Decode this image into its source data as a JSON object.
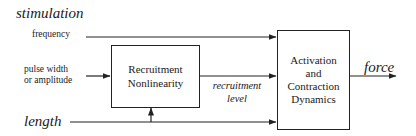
{
  "diagram": {
    "inputs": {
      "stimulation_label": "stimulation",
      "frequency_label": "frequency",
      "pulse_label_line1": "pulse width",
      "pulse_label_line2": "or amplitude",
      "length_label": "length"
    },
    "blocks": {
      "recruitment": {
        "line1": "Recruitment",
        "line2": "Nonlinearity"
      },
      "activation": {
        "line1": "Activation",
        "line2": "and",
        "line3": "Contraction",
        "line4": "Dynamics"
      }
    },
    "signals": {
      "recruitment_level_line1": "recruitment",
      "recruitment_level_line2": "level",
      "output_label": "force"
    },
    "colors": {
      "line": "#222222",
      "background": "#ffffff"
    }
  }
}
